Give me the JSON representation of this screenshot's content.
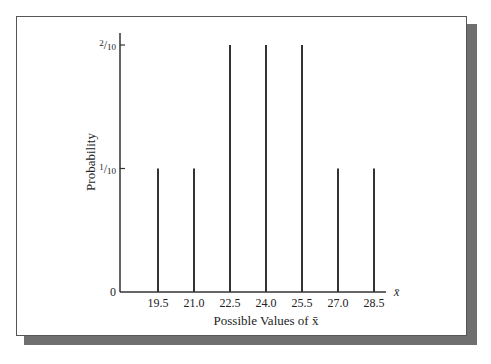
{
  "chart_data": {
    "type": "bar",
    "title": "",
    "xlabel": "Possible Values of x̄",
    "ylabel": "Probability",
    "x_axis_symbol": "x̄",
    "categories": [
      "19.5",
      "21.0",
      "22.5",
      "24.0",
      "25.5",
      "27.0",
      "28.5"
    ],
    "values": [
      0.1,
      0.1,
      0.2,
      0.2,
      0.2,
      0.1,
      0.1
    ],
    "value_labels": [
      "1/10",
      "1/10",
      "2/10",
      "2/10",
      "2/10",
      "1/10",
      "1/10"
    ],
    "y_ticks": [
      {
        "value": 0,
        "label": "0"
      },
      {
        "value": 0.1,
        "label": "1/10"
      },
      {
        "value": 0.2,
        "label": "2/10"
      }
    ],
    "ylim": [
      0,
      0.2
    ],
    "grid": false,
    "legend": null,
    "style": "vertical line (spike) plot"
  },
  "colors": {
    "bars": "#333333",
    "axis": "#333333",
    "frame_shadow": "#6f6f6f",
    "background": "#ffffff"
  }
}
